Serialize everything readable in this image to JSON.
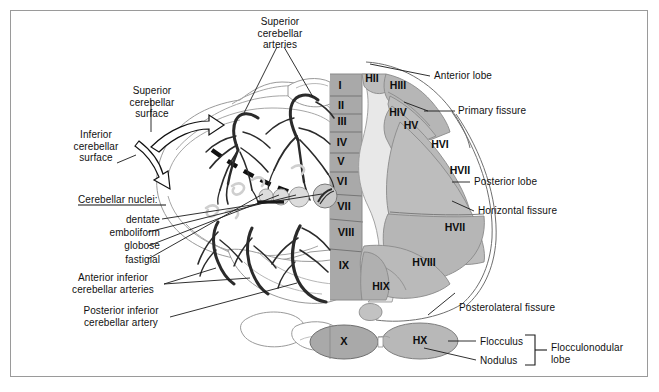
{
  "figure": {
    "type": "anatomical-diagram",
    "background_color": "#ffffff",
    "border_color": "#9a9a9a"
  },
  "colors": {
    "vermis_fill": "#a9a9a9",
    "paravermal_fill": "#e6e6e6",
    "hemisphere_fill": "#bcbcbc",
    "hemisphere_fill_dark": "#b2b2b2",
    "outline": "#8e8e8e",
    "vessel": "#2b2b2b",
    "text": "#111111"
  },
  "left_labels": {
    "superior_cerebellar_arteries": "Superior\ncerebellar\narteries",
    "superior_cerebellar_surface": "Superior\ncerebellar\nsurface",
    "inferior_cerebellar_surface": "Inferior\ncerebellar\nsurface",
    "cerebellar_nuclei_heading": "Cerebellar nuclei:",
    "nuclei": [
      "dentate",
      "emboliform",
      "globose",
      "fastigial"
    ],
    "anterior_inferior_cerebellar_arteries": "Anterior inferior\ncerebellar arteries",
    "posterior_inferior_cerebellar_artery": "Posterior inferior\ncerebellar artery"
  },
  "right_labels": {
    "anterior_lobe": "Anterior lobe",
    "primary_fissure": "Primary fissure",
    "posterior_lobe": "Posterior lobe",
    "horizontal_fissure": "Horizontal fissure",
    "posterolateral_fissure": "Posterolateral fissure",
    "flocculus": "Flocculus",
    "nodulus": "Nodulus",
    "flocculonodular_lobe": "Flocculonodular\nlobe"
  },
  "vermis_lobules": [
    {
      "label": "I",
      "x": 340,
      "y": 86
    },
    {
      "label": "II",
      "x": 341,
      "y": 106
    },
    {
      "label": "III",
      "x": 342,
      "y": 122
    },
    {
      "label": "IV",
      "x": 342,
      "y": 143
    },
    {
      "label": "V",
      "x": 341,
      "y": 162
    },
    {
      "label": "VI",
      "x": 342,
      "y": 182
    },
    {
      "label": "VII",
      "x": 344,
      "y": 207
    },
    {
      "label": "VIII",
      "x": 346,
      "y": 233
    },
    {
      "label": "IX",
      "x": 344,
      "y": 266
    },
    {
      "label": "X",
      "x": 344,
      "y": 342
    }
  ],
  "hemisphere_lobules": [
    {
      "label": "HII",
      "x": 372,
      "y": 79
    },
    {
      "label": "HIII",
      "x": 398,
      "y": 86
    },
    {
      "label": "HIV",
      "x": 398,
      "y": 113
    },
    {
      "label": "HV",
      "x": 411,
      "y": 126
    },
    {
      "label": "HVI",
      "x": 440,
      "y": 145
    },
    {
      "label": "HVII",
      "x": 460,
      "y": 171
    },
    {
      "label": "HVII",
      "x": 455,
      "y": 228
    },
    {
      "label": "HVIII",
      "x": 424,
      "y": 263
    },
    {
      "label": "HIX",
      "x": 381,
      "y": 287
    },
    {
      "label": "HX",
      "x": 420,
      "y": 341
    }
  ]
}
